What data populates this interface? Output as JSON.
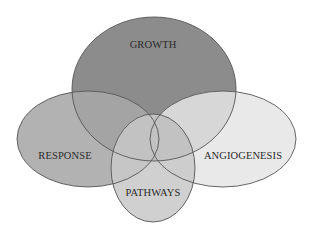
{
  "diagram": {
    "type": "venn",
    "sets": [
      {
        "id": "growth",
        "label": "GROWTH",
        "fill": "#8c8c8c",
        "ellipse": {
          "cx": 154,
          "cy": 89,
          "rx": 82,
          "ry": 72
        },
        "label_pos": {
          "x": 153,
          "y": 48
        }
      },
      {
        "id": "response",
        "label": "RESPONSE",
        "fill": "#b2b2b2",
        "ellipse": {
          "cx": 88,
          "cy": 139,
          "rx": 71,
          "ry": 48
        },
        "label_pos": {
          "x": 65,
          "y": 159
        }
      },
      {
        "id": "angiogenesis",
        "label": "ANGIOGENESIS",
        "fill": "#e9e9e9",
        "ellipse": {
          "cx": 223,
          "cy": 139,
          "rx": 73,
          "ry": 48
        },
        "label_pos": {
          "x": 243,
          "y": 159
        }
      },
      {
        "id": "pathways",
        "label": "PATHWAYS",
        "fill": "#d0d0d0",
        "ellipse": {
          "cx": 153,
          "cy": 168,
          "rx": 42,
          "ry": 54
        },
        "label_pos": {
          "x": 153,
          "y": 196
        }
      }
    ],
    "stroke_color": "#555555",
    "background": "#ffffff"
  }
}
